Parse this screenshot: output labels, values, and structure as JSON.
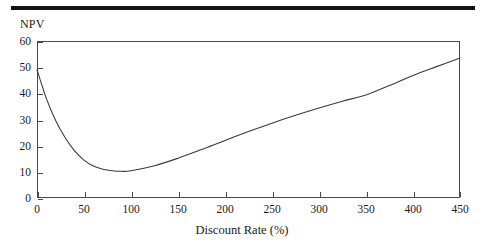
{
  "figure": {
    "header_rule": true,
    "y_axis_title": "NPV",
    "x_axis_title": "Discount Rate (%)"
  },
  "chart_data": {
    "type": "line",
    "title": "",
    "subtitle": "",
    "xlabel": "Discount Rate (%)",
    "ylabel": "NPV",
    "xlim": [
      0,
      450
    ],
    "ylim": [
      0,
      60
    ],
    "xticks": [
      0,
      50,
      100,
      150,
      200,
      250,
      300,
      350,
      400,
      450
    ],
    "yticks": [
      0,
      10,
      20,
      30,
      40,
      50,
      60
    ],
    "grid": false,
    "legend": "none",
    "annotations": [],
    "series": [
      {
        "name": "NPV",
        "color": "#3b3b3b",
        "x": [
          0,
          10,
          20,
          30,
          40,
          50,
          60,
          70,
          80,
          90,
          100,
          125,
          150,
          175,
          200,
          225,
          250,
          275,
          300,
          325,
          350,
          375,
          400,
          425,
          450
        ],
        "y": [
          49.0,
          38.0,
          29.5,
          23.0,
          18.0,
          14.5,
          12.2,
          11.0,
          10.4,
          10.2,
          10.4,
          12.3,
          15.2,
          18.5,
          22.0,
          25.4,
          28.6,
          31.6,
          34.4,
          37.0,
          39.4,
          43.0,
          46.8,
          50.2,
          53.5
        ]
      }
    ]
  }
}
